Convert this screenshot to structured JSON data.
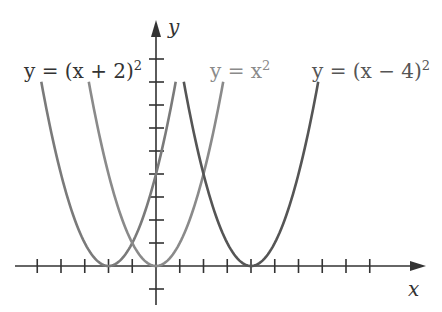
{
  "chart_data": {
    "type": "line",
    "title": "",
    "xlabel": "x",
    "ylabel": "y",
    "xlim": [
      -5,
      11
    ],
    "ylim": [
      -1,
      10
    ],
    "x_ticks": [
      -5,
      -4,
      -3,
      -2,
      -1,
      1,
      2,
      3,
      4,
      5,
      6,
      7,
      8,
      9
    ],
    "y_ticks": [
      -1,
      1,
      2,
      3,
      4,
      5,
      6,
      7,
      8,
      9
    ],
    "grid": false,
    "legend": "inline labels above curves",
    "series": [
      {
        "name": "y = (x + 2)^2",
        "vertex": [
          -2,
          0
        ],
        "x_range": [
          -4.83,
          0.83
        ],
        "color": "#7a7a7a"
      },
      {
        "name": "y = x^2",
        "vertex": [
          0,
          0
        ],
        "x_range": [
          -2.83,
          2.83
        ],
        "color": "#8a8a8a"
      },
      {
        "name": "y = (x - 4)^2",
        "vertex": [
          4,
          0
        ],
        "x_range": [
          1.17,
          6.83
        ],
        "color": "#555555"
      }
    ],
    "labels": {
      "left": {
        "pre": "y = (x + 2)",
        "sup": "2"
      },
      "middle": {
        "pre": "y = x",
        "sup": "2"
      },
      "right": {
        "pre": "y = (x − 4)",
        "sup": "2"
      }
    },
    "axis_labels": {
      "x": "x",
      "y": "y"
    }
  }
}
